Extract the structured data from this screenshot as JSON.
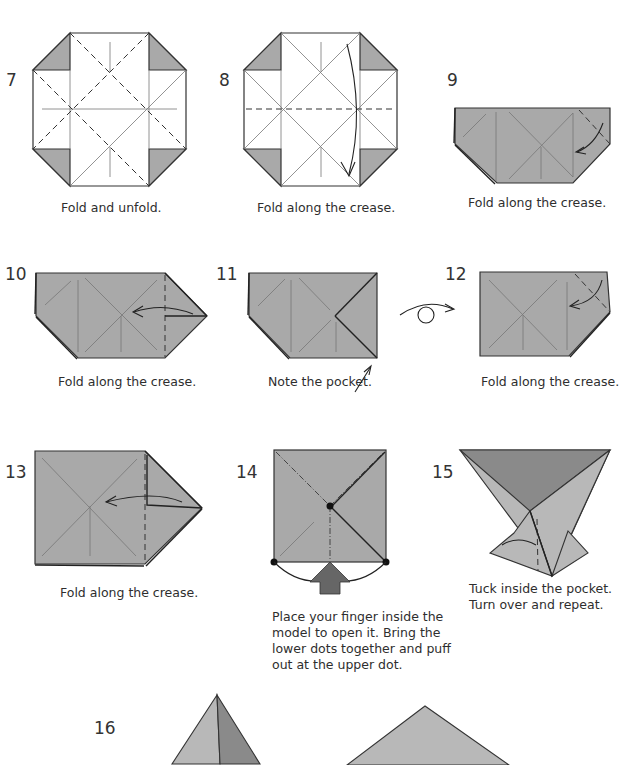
{
  "steps": [
    {
      "number": "7",
      "caption": "Fold and unfold."
    },
    {
      "number": "8",
      "caption": "Fold along the crease."
    },
    {
      "number": "9",
      "caption": "Fold along the crease."
    },
    {
      "number": "10",
      "caption": "Fold along the crease."
    },
    {
      "number": "11",
      "caption": "Note the pocket."
    },
    {
      "number": "12",
      "caption": "Fold along the crease."
    },
    {
      "number": "13",
      "caption": "Fold along the crease."
    },
    {
      "number": "14",
      "caption_lines": [
        "Place your finger inside the",
        "model to open it. Bring the",
        "lower dots together and puff",
        "out at the upper dot."
      ]
    },
    {
      "number": "15",
      "caption_lines": [
        "Tuck inside the pocket.",
        "Turn over and repeat."
      ]
    },
    {
      "number": "16"
    }
  ],
  "icons": {
    "turn_over": "turn-over-symbol",
    "push_arrow": "push-arrow"
  },
  "colors": {
    "paper_white": "#ffffff",
    "paper_gray": "#a9a9a9",
    "paper_dark": "#8a8a8a",
    "line": "#333333"
  }
}
